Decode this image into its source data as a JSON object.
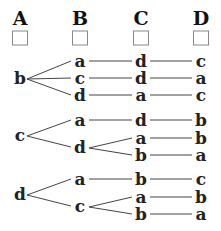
{
  "columns": [
    {
      "label": "A",
      "x": 20
    },
    {
      "label": "B",
      "x": 80
    },
    {
      "label": "C",
      "x": 141
    },
    {
      "label": "D",
      "x": 201
    }
  ],
  "tree": [
    {
      "root": "b",
      "y": 79,
      "branches": [
        {
          "B": "a",
          "y": 62,
          "C": [
            {
              "v": "d",
              "y": 62,
              "D": "c"
            }
          ]
        },
        {
          "B": "c",
          "y": 79,
          "C": [
            {
              "v": "d",
              "y": 79,
              "D": "a"
            }
          ]
        },
        {
          "B": "d",
          "y": 96,
          "C": [
            {
              "v": "a",
              "y": 96,
              "D": "c"
            }
          ]
        }
      ]
    },
    {
      "root": "c",
      "y": 136,
      "branches": [
        {
          "B": "a",
          "y": 121,
          "C": [
            {
              "v": "d",
              "y": 121,
              "D": "b"
            }
          ]
        },
        {
          "B": "d",
          "y": 148,
          "C": [
            {
              "v": "a",
              "y": 139,
              "D": "b"
            },
            {
              "v": "b",
              "y": 156,
              "D": "a"
            }
          ]
        }
      ]
    },
    {
      "root": "d",
      "y": 195,
      "branches": [
        {
          "B": "a",
          "y": 180,
          "C": [
            {
              "v": "b",
              "y": 180,
              "D": "c"
            }
          ]
        },
        {
          "B": "c",
          "y": 207,
          "C": [
            {
              "v": "a",
              "y": 198,
              "D": "b"
            },
            {
              "v": "b",
              "y": 215,
              "D": "a"
            }
          ]
        }
      ]
    }
  ]
}
